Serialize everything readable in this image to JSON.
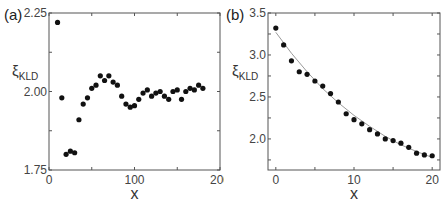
{
  "chart_data": [
    {
      "panel_label": "(a)",
      "type": "scatter",
      "title": "",
      "xlabel": "x",
      "ylabel": "ξ",
      "ylabel_sub": "KLD",
      "xlim": [
        0,
        200
      ],
      "ylim": [
        1.75,
        2.25
      ],
      "xticks": [
        0,
        100,
        200
      ],
      "xtick_labels": [
        "0",
        "100",
        "200"
      ],
      "xminor": [
        50,
        150
      ],
      "yticks": [
        1.75,
        2.0,
        2.25
      ],
      "ytick_labels": [
        "1.75",
        "2.00",
        "2.25"
      ],
      "yminor": [
        1.875,
        2.125
      ],
      "grid": false,
      "series": [
        {
          "name": "data",
          "marker": "circle",
          "color": "#111111",
          "x": [
            10,
            15,
            20,
            25,
            30,
            35,
            40,
            45,
            50,
            55,
            60,
            65,
            70,
            75,
            80,
            85,
            90,
            95,
            100,
            105,
            110,
            115,
            120,
            125,
            130,
            135,
            140,
            145,
            150,
            155,
            160,
            165,
            170,
            175,
            180
          ],
          "y": [
            2.22,
            1.98,
            1.8,
            1.81,
            1.805,
            1.91,
            1.96,
            1.98,
            2.01,
            2.02,
            2.05,
            2.035,
            2.05,
            2.03,
            2.02,
            1.985,
            1.96,
            1.95,
            1.955,
            1.975,
            1.995,
            2.005,
            1.985,
            1.995,
            2.0,
            1.985,
            1.975,
            2.0,
            2.005,
            1.975,
            2.0,
            2.01,
            2.005,
            2.02,
            2.01
          ]
        }
      ]
    },
    {
      "panel_label": "(b)",
      "type": "scatter",
      "title": "",
      "xlabel": "x",
      "ylabel": "ξ",
      "ylabel_sub": "KLD",
      "xlim": [
        -1,
        21
      ],
      "ylim": [
        1.63,
        3.5
      ],
      "xticks": [
        0,
        10,
        20
      ],
      "xtick_labels": [
        "0",
        "10",
        "20"
      ],
      "xminor": [
        5,
        15
      ],
      "yticks": [
        2.0,
        2.5,
        3.0,
        3.5
      ],
      "ytick_labels": [
        "2.0",
        "2.5",
        "3.0",
        "3.5"
      ],
      "yminor": [
        1.75,
        2.25,
        2.75,
        3.25
      ],
      "grid": false,
      "series": [
        {
          "name": "data",
          "marker": "circle",
          "color": "#111111",
          "x": [
            0,
            1,
            2,
            3,
            4,
            5,
            6,
            7,
            8,
            9,
            10,
            11,
            12,
            13,
            14,
            15,
            16,
            17,
            18,
            19,
            20
          ],
          "y": [
            3.32,
            3.12,
            2.93,
            2.8,
            2.77,
            2.69,
            2.63,
            2.54,
            2.44,
            2.3,
            2.23,
            2.18,
            2.11,
            2.06,
            2.0,
            1.98,
            1.95,
            1.9,
            1.83,
            1.81,
            1.8
          ]
        },
        {
          "name": "fit",
          "marker": "none",
          "line": "solid",
          "color": "#9a9a9a",
          "x": [
            0,
            2,
            4,
            6,
            8,
            10,
            12,
            14,
            16,
            18,
            20
          ],
          "y": [
            3.27,
            3.02,
            2.8,
            2.6,
            2.43,
            2.28,
            2.15,
            2.03,
            1.93,
            1.85,
            1.78
          ]
        }
      ]
    }
  ]
}
